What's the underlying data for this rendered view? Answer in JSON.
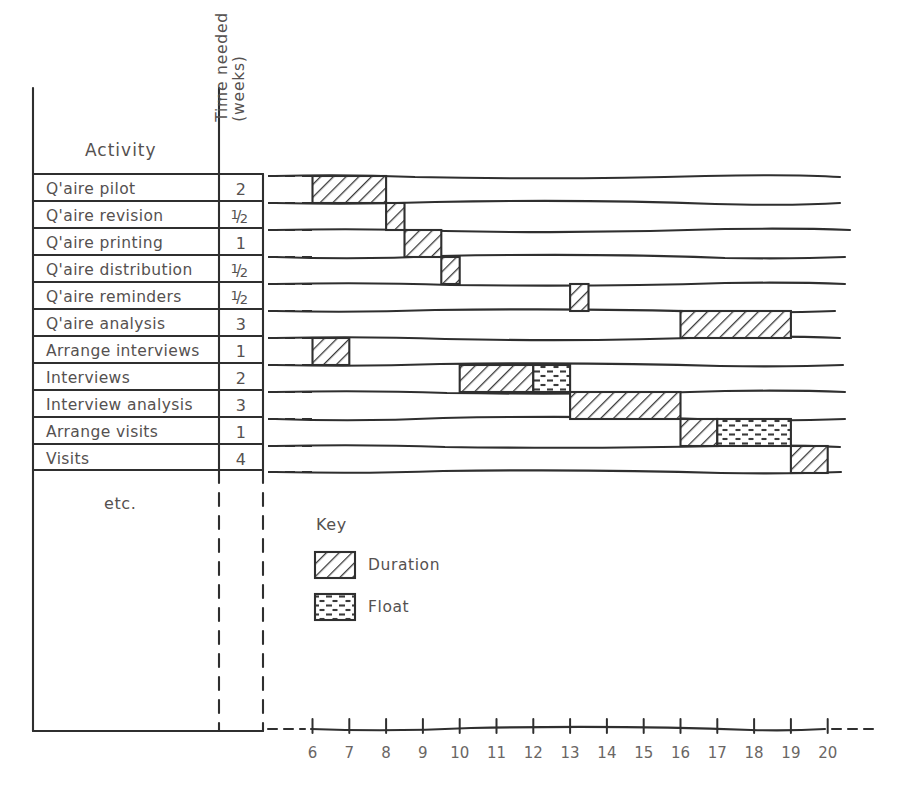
{
  "table": {
    "header_activity": "Activity",
    "header_time_line1": "Time needed",
    "header_time_line2": "(weeks)",
    "footer_note": "etc.",
    "rows": [
      {
        "activity": "Q'aire pilot",
        "duration": "2",
        "dur_num": "",
        "dur_den": ""
      },
      {
        "activity": "Q'aire revision",
        "duration": "1/2",
        "dur_num": "1",
        "dur_den": "2"
      },
      {
        "activity": "Q'aire printing",
        "duration": "1",
        "dur_num": "",
        "dur_den": ""
      },
      {
        "activity": "Q'aire distribution",
        "duration": "1/2",
        "dur_num": "1",
        "dur_den": "2"
      },
      {
        "activity": "Q'aire reminders",
        "duration": "1/2",
        "dur_num": "1",
        "dur_den": "2"
      },
      {
        "activity": "Q'aire analysis",
        "duration": "3",
        "dur_num": "",
        "dur_den": ""
      },
      {
        "activity": "Arrange interviews",
        "duration": "1",
        "dur_num": "",
        "dur_den": ""
      },
      {
        "activity": "Interviews",
        "duration": "2",
        "dur_num": "",
        "dur_den": ""
      },
      {
        "activity": "Interview analysis",
        "duration": "3",
        "dur_num": "",
        "dur_den": ""
      },
      {
        "activity": "Arrange visits",
        "duration": "1",
        "dur_num": "",
        "dur_den": ""
      },
      {
        "activity": "Visits",
        "duration": "4",
        "dur_num": "",
        "dur_den": ""
      }
    ]
  },
  "legend": {
    "title": "Key",
    "items": [
      {
        "label": "Duration",
        "pattern": "diagonal-hatch"
      },
      {
        "label": "Float",
        "pattern": "dashed-stipple"
      }
    ]
  },
  "axis": {
    "label": "",
    "ticks": [
      "6",
      "7",
      "8",
      "9",
      "10",
      "11",
      "12",
      "13",
      "14",
      "15",
      "16",
      "17",
      "18",
      "19",
      "20"
    ],
    "min": 6,
    "max": 20
  },
  "chart_data": {
    "type": "bar",
    "xlabel": "weeks",
    "ylabel": "Activity",
    "xlim": [
      6,
      20
    ],
    "grid": false,
    "legend_position": "inside-lower-left",
    "categories": [
      "Q'aire pilot",
      "Q'aire revision",
      "Q'aire printing",
      "Q'aire distribution",
      "Q'aire reminders",
      "Q'aire analysis",
      "Arrange interviews",
      "Interviews",
      "Interview analysis",
      "Arrange visits",
      "Visits"
    ],
    "series": [
      {
        "name": "Duration",
        "bars": [
          {
            "activity": "Q'aire pilot",
            "start": 6.0,
            "end": 8.0,
            "weeks": 2
          },
          {
            "activity": "Q'aire revision",
            "start": 8.0,
            "end": 8.5,
            "weeks": 0.5
          },
          {
            "activity": "Q'aire printing",
            "start": 8.5,
            "end": 9.5,
            "weeks": 1
          },
          {
            "activity": "Q'aire distribution",
            "start": 9.5,
            "end": 10.0,
            "weeks": 0.5
          },
          {
            "activity": "Q'aire reminders",
            "start": 13.0,
            "end": 13.5,
            "weeks": 0.5
          },
          {
            "activity": "Q'aire analysis",
            "start": 16.0,
            "end": 19.0,
            "weeks": 3
          },
          {
            "activity": "Arrange interviews",
            "start": 6.0,
            "end": 7.0,
            "weeks": 1
          },
          {
            "activity": "Interviews",
            "start": 10.0,
            "end": 12.0,
            "weeks": 2
          },
          {
            "activity": "Interview analysis",
            "start": 13.0,
            "end": 16.0,
            "weeks": 3
          },
          {
            "activity": "Arrange visits",
            "start": 16.0,
            "end": 17.0,
            "weeks": 1
          },
          {
            "activity": "Visits",
            "start": 19.0,
            "end": 20.0,
            "weeks": 4
          }
        ]
      },
      {
        "name": "Float",
        "bars": [
          {
            "activity": "Interviews",
            "start": 12.0,
            "end": 13.0,
            "weeks": 1
          },
          {
            "activity": "Arrange visits",
            "start": 17.0,
            "end": 19.0,
            "weeks": 2
          }
        ]
      }
    ]
  }
}
